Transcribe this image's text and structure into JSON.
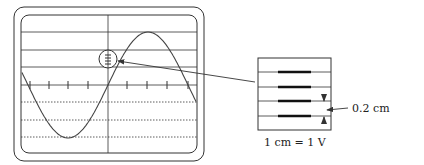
{
  "diagram": {
    "colors": {
      "line": "#333333",
      "trace": "#444444",
      "bg": "#ffffff"
    },
    "oscilloscope": {
      "outer_frame": {
        "x": 14,
        "y": 7,
        "w": 190,
        "h": 154,
        "r": 10
      },
      "screen": {
        "x": 21,
        "y": 15,
        "w": 176,
        "h": 138,
        "r": 8
      },
      "horizontal_solid_lines_y": [
        32,
        50,
        67
      ],
      "horizontal_dotted_lines_y": [
        102,
        120,
        137
      ],
      "center_axis_y": 85,
      "vertical_axis_x": 108,
      "tick_marks_x": [
        30,
        49,
        68,
        88,
        127,
        147,
        167,
        188
      ],
      "zoom_circle": {
        "cx": 108,
        "cy": 59,
        "r": 9
      }
    },
    "inset": {
      "box": {
        "x": 258,
        "y": 58,
        "w": 73,
        "h": 72
      },
      "rows_y": [
        72,
        87,
        101,
        116
      ],
      "bars": {
        "x1": 278,
        "x2": 311
      }
    },
    "labels": {
      "spacing": "0.2 cm",
      "scale": "1 cm = 1 V"
    }
  }
}
